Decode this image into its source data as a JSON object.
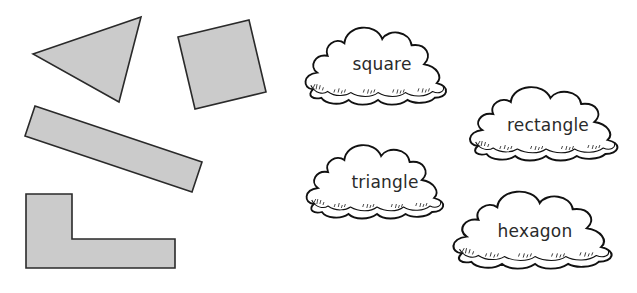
{
  "shapes": [
    {
      "id": "triangle",
      "points": "33,54 141,17 119,102",
      "fill": "#cbcbcb"
    },
    {
      "id": "square",
      "points": "178,37 249,20 266,92 195,109",
      "fill": "#cbcbcb"
    },
    {
      "id": "rectangle",
      "points": "35,106 202,162 192,192 25,136",
      "fill": "#cbcbcb"
    },
    {
      "id": "l-hexagon",
      "points": "26,194 72,194 72,239 175,239 175,268 26,268",
      "fill": "#cbcbcb"
    }
  ],
  "clouds": [
    {
      "label": "square",
      "cx": 378,
      "cy": 64
    },
    {
      "label": "rectangle",
      "cx": 546,
      "cy": 125
    },
    {
      "label": "triangle",
      "cx": 385,
      "cy": 182
    },
    {
      "label": "hexagon",
      "cx": 537,
      "cy": 231
    }
  ]
}
